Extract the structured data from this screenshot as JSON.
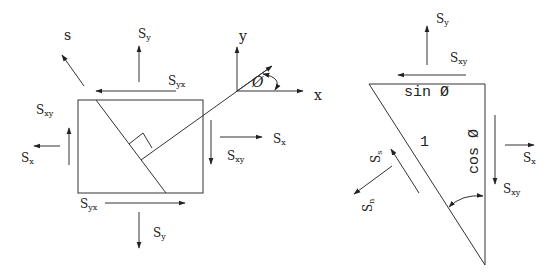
{
  "left_diagram": {
    "axis_labels": {
      "x": "x",
      "y": "y",
      "s": "s",
      "angle": "Ø"
    },
    "labels": {
      "sy_top": {
        "main": "S",
        "sub": "y"
      },
      "syx_top": {
        "main": "S",
        "sub": "yx"
      },
      "sxy_left": {
        "main": "S",
        "sub": "xy"
      },
      "sx_left": {
        "main": "S",
        "sub": "x"
      },
      "sx_right": {
        "main": "S",
        "sub": "x"
      },
      "sxy_right": {
        "main": "S",
        "sub": "xy"
      },
      "syx_bottom": {
        "main": "S",
        "sub": "yx"
      },
      "sy_bottom": {
        "main": "S",
        "sub": "y"
      }
    }
  },
  "right_diagram": {
    "labels": {
      "sy": {
        "main": "S",
        "sub": "y"
      },
      "sxy_top": {
        "main": "S",
        "sub": "xy"
      },
      "sin_phi": "sin Ø",
      "cos_phi": "cos Ø",
      "hypotenuse": "1",
      "sx": {
        "main": "S",
        "sub": "x"
      },
      "sxy_right": {
        "main": "S",
        "sub": "xy"
      },
      "ss": {
        "main": "S",
        "sub": "s"
      },
      "sn": {
        "main": "S",
        "sub": "n"
      }
    }
  },
  "colors": {
    "stroke": "#333333",
    "text": "#222222",
    "background": "#ffffff"
  }
}
